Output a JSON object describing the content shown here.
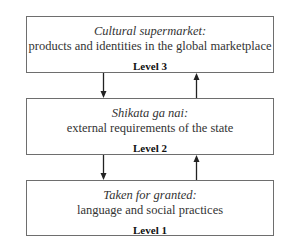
{
  "diagram": {
    "levels": [
      {
        "title": "Cultural supermarket:",
        "description": "products and identities in the global marketplace",
        "level": "Level 3"
      },
      {
        "title": "Shikata ga nai:",
        "description": "external requirements of the state",
        "level": "Level 2"
      },
      {
        "title": "Taken for granted:",
        "description": "language and social practices",
        "level": "Level 1"
      }
    ],
    "arrows": [
      {
        "from": "Level 3",
        "to": "Level 2",
        "direction": "down"
      },
      {
        "from": "Level 2",
        "to": "Level 3",
        "direction": "up"
      },
      {
        "from": "Level 2",
        "to": "Level 1",
        "direction": "down"
      },
      {
        "from": "Level 1",
        "to": "Level 2",
        "direction": "up"
      }
    ]
  }
}
